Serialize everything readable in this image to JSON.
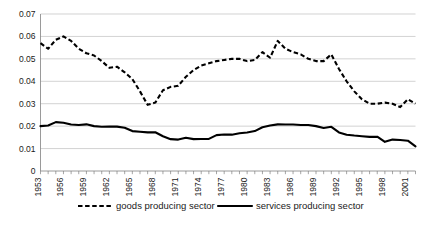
{
  "chart_data": {
    "type": "line",
    "title": "",
    "xlabel": "",
    "ylabel": "",
    "ylim": [
      0,
      0.07
    ],
    "ytick_values": [
      0,
      0.01,
      0.02,
      0.03,
      0.04,
      0.05,
      0.06,
      0.07
    ],
    "ytick_labels": [
      "0",
      "0.01",
      "0.02",
      "0.03",
      "0.04",
      "0.05",
      "0.06",
      "0.07"
    ],
    "grid": true,
    "legend_position": "bottom",
    "x": [
      1953,
      1954,
      1955,
      1956,
      1957,
      1958,
      1959,
      1960,
      1961,
      1962,
      1963,
      1964,
      1965,
      1966,
      1967,
      1968,
      1969,
      1970,
      1971,
      1972,
      1973,
      1974,
      1975,
      1976,
      1977,
      1978,
      1979,
      1980,
      1981,
      1982,
      1983,
      1984,
      1985,
      1986,
      1987,
      1988,
      1989,
      1990,
      1991,
      1992,
      1993,
      1994,
      1995,
      1996,
      1997,
      1998,
      1999,
      2000,
      2001,
      2002
    ],
    "xtick_labels": [
      "1953",
      "1956",
      "1959",
      "1962",
      "1965",
      "1968",
      "1971",
      "1974",
      "1977",
      "1980",
      "1983",
      "1986",
      "1989",
      "1992",
      "1995",
      "1998",
      "2001"
    ],
    "xtick_step": 3,
    "series": [
      {
        "name": "goods producing sector",
        "style": "dashed",
        "color": "#000000",
        "values": [
          0.057,
          0.0545,
          0.0585,
          0.06,
          0.058,
          0.0545,
          0.0525,
          0.0515,
          0.049,
          0.046,
          0.0465,
          0.044,
          0.041,
          0.0355,
          0.0295,
          0.0305,
          0.036,
          0.0375,
          0.038,
          0.042,
          0.045,
          0.047,
          0.048,
          0.049,
          0.0495,
          0.05,
          0.05,
          0.049,
          0.0495,
          0.053,
          0.0505,
          0.058,
          0.0545,
          0.053,
          0.052,
          0.05,
          0.049,
          0.049,
          0.052,
          0.0455,
          0.04,
          0.0355,
          0.032,
          0.03,
          0.03,
          0.0305,
          0.03,
          0.0285,
          0.032,
          0.03
        ],
        "ymin_observed": 0.0285,
        "ymax_observed": 0.06
      },
      {
        "name": "services producing sector",
        "style": "solid",
        "color": "#000000",
        "values": [
          0.02,
          0.0203,
          0.0218,
          0.0215,
          0.0207,
          0.0205,
          0.0208,
          0.02,
          0.0197,
          0.0198,
          0.0198,
          0.0193,
          0.0178,
          0.0175,
          0.0172,
          0.0173,
          0.0155,
          0.0142,
          0.014,
          0.0148,
          0.0142,
          0.0143,
          0.0143,
          0.016,
          0.0163,
          0.0162,
          0.0168,
          0.0172,
          0.0178,
          0.0195,
          0.0203,
          0.0208,
          0.0207,
          0.0207,
          0.0205,
          0.0205,
          0.02,
          0.0192,
          0.0197,
          0.0172,
          0.0162,
          0.0158,
          0.0155,
          0.0152,
          0.0153,
          0.013,
          0.014,
          0.0138,
          0.0135,
          0.011
        ],
        "ymin_observed": 0.011,
        "ymax_observed": 0.0218
      }
    ]
  },
  "legend": {
    "items": [
      {
        "label": "goods producing sector",
        "style": "dashed"
      },
      {
        "label": "services producing sector",
        "style": "solid"
      }
    ]
  }
}
